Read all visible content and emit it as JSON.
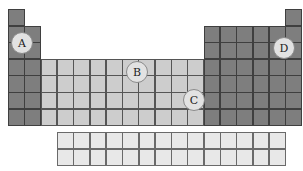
{
  "diagram": {
    "type": "periodic-table-outline",
    "main_table": {
      "columns": 18,
      "rows": 7
    },
    "f_block": {
      "columns": 14,
      "rows": 2
    },
    "colors": {
      "s_p_block": "#7e7e7e",
      "d_block": "#cdcdcd",
      "f_block": "#e8e8e8",
      "marker_fill": "#e2e2e2"
    },
    "markers": [
      {
        "label": "A",
        "x": 22,
        "y": 43
      },
      {
        "label": "B",
        "x": 137,
        "y": 72
      },
      {
        "label": "C",
        "x": 194,
        "y": 100
      },
      {
        "label": "D",
        "x": 284,
        "y": 48
      }
    ]
  }
}
